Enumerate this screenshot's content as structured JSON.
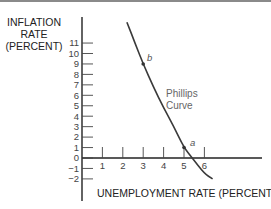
{
  "chart_data": {
    "type": "line",
    "title": "",
    "xlabel": "UNEMPLOYMENT RATE (PERCENT)",
    "ylabel": "INFLATION RATE (PERCENT)",
    "ylabel_lines": [
      "INFLATION",
      "RATE",
      "(PERCENT)"
    ],
    "x_ticks": [
      1,
      2,
      3,
      4,
      5,
      6
    ],
    "y_ticks": [
      11,
      10,
      9,
      8,
      7,
      6,
      5,
      4,
      3,
      2,
      1,
      0,
      -1,
      -2
    ],
    "y_tick_labels": [
      "11",
      "10",
      "9",
      "8",
      "7",
      "6",
      "5",
      "4",
      "3",
      "2",
      "1",
      "0",
      "−1",
      "−2"
    ],
    "xlim": [
      0,
      8.8
    ],
    "ylim": [
      -4,
      13.3
    ],
    "grid": false,
    "series": [
      {
        "name": "Phillips Curve",
        "x": [
          2.2,
          2.6,
          3.0,
          3.5,
          4.0,
          4.5,
          5.0,
          5.4,
          6.0,
          6.4
        ],
        "y": [
          13.0,
          11.0,
          9.0,
          6.8,
          4.8,
          3.0,
          1.0,
          0.0,
          -1.5,
          -2.0
        ]
      }
    ],
    "annotations": [
      {
        "label": "b",
        "x": 3.0,
        "y": 9.0
      },
      {
        "label": "a",
        "x": 5.0,
        "y": 1.0
      },
      {
        "label": "Phillips Curve",
        "x": 4.2,
        "y": 6.2
      }
    ]
  },
  "labels": {
    "ylabel_line1": "INFLATION",
    "ylabel_line2": "RATE",
    "ylabel_line3": "(PERCENT)",
    "xlabel": "UNEMPLOYMENT RATE (PERCENT)",
    "curve_line1": "Phillips",
    "curve_line2": "Curve",
    "point_a": "a",
    "point_b": "b"
  }
}
